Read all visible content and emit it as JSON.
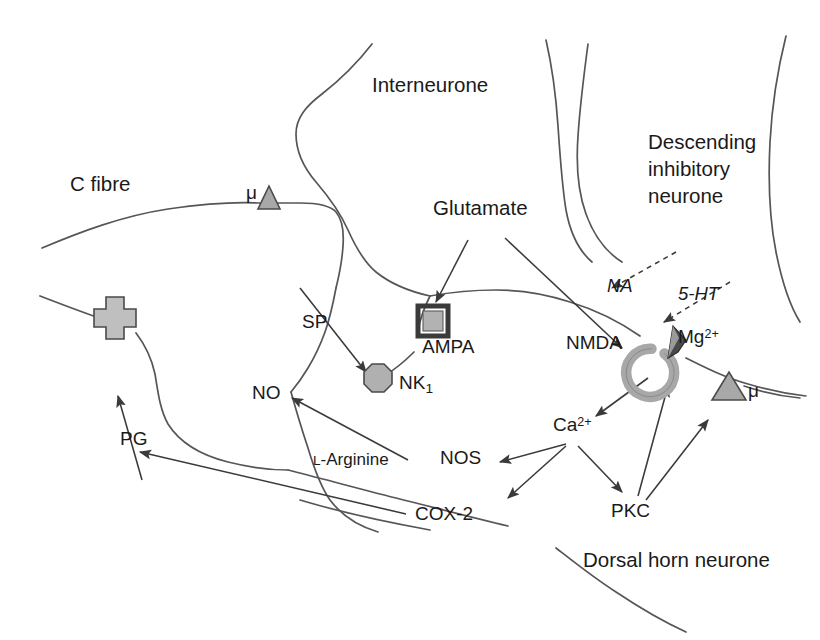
{
  "figure": {
    "width": 820,
    "height": 640,
    "background": "#ffffff",
    "line_color": "#4a4a4a",
    "text_color": "#1a1a1a",
    "receptor_fill": "#a8a8a8",
    "receptor_stroke": "#555555",
    "mg_fill": "#3a3a3a"
  },
  "labels": {
    "c_fibre": "C fibre",
    "interneurone": "Interneurone",
    "descending_line1": "Descending",
    "descending_line2": "inhibitory",
    "descending_line3": "neurone",
    "glutamate": "Glutamate",
    "dorsal_horn": "Dorsal horn neurone",
    "na": "NA",
    "five_ht": "5-HT",
    "sp": "SP",
    "no": "NO",
    "pg": "PG",
    "l_arginine_prefix": "L",
    "l_arginine_rest": "-Arginine",
    "nos": "NOS",
    "cox2": "COX-2",
    "pkc": "PKC",
    "ampa": "AMPA",
    "nmda": "NMDA",
    "nk1_base": "NK",
    "nk1_sub": "1",
    "mg_base": "Mg",
    "mg_sup": "2+",
    "ca_base": "Ca",
    "ca_sup": "2+",
    "mu_left": "μ",
    "mu_right": "μ"
  },
  "receptors": [
    {
      "name": "mu-opioid-receptor-left",
      "shape": "triangle",
      "label": "μ"
    },
    {
      "name": "mu-opioid-receptor-right",
      "shape": "triangle",
      "label": "μ"
    },
    {
      "name": "nk1-receptor",
      "shape": "octagon",
      "label": "NK1"
    },
    {
      "name": "ampa-receptor",
      "shape": "square",
      "label": "AMPA"
    },
    {
      "name": "nmda-receptor",
      "shape": "c-ring",
      "label": "NMDA"
    },
    {
      "name": "prostaglandin-receptor",
      "shape": "cross",
      "label": "PG receptor"
    },
    {
      "name": "magnesium-block",
      "shape": "wedge",
      "label": "Mg2+"
    }
  ],
  "arrows": [
    {
      "from": "Glutamate",
      "to": "AMPA",
      "style": "solid"
    },
    {
      "from": "Glutamate",
      "to": "NMDA",
      "style": "solid"
    },
    {
      "from": "NA",
      "to": "synapse",
      "style": "dashed"
    },
    {
      "from": "5-HT",
      "to": "synapse",
      "style": "dashed"
    },
    {
      "from": "NMDA",
      "to": "Ca2+",
      "style": "solid"
    },
    {
      "from": "Ca2+",
      "to": "NOS",
      "style": "solid"
    },
    {
      "from": "Ca2+",
      "to": "COX-2",
      "style": "solid"
    },
    {
      "from": "Ca2+",
      "to": "PKC",
      "style": "solid"
    },
    {
      "from": "PKC",
      "to": "NMDA",
      "style": "solid"
    },
    {
      "from": "PKC",
      "to": "mu-right",
      "style": "solid"
    },
    {
      "from": "NOS",
      "to": "NO",
      "style": "solid"
    },
    {
      "from": "COX-2",
      "to": "PG",
      "style": "solid"
    },
    {
      "from": "PG",
      "to": "PG-receptor",
      "style": "solid"
    }
  ]
}
